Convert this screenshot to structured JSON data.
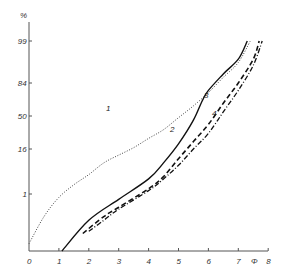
{
  "chart_data": {
    "type": "line",
    "title": "",
    "xlabel": "Φ",
    "ylabel": "%",
    "x_ticks": [
      "0",
      "1",
      "2",
      "3",
      "4",
      "5",
      "6",
      "7",
      "8"
    ],
    "y_ticks": [
      "99",
      "84",
      "50",
      "16",
      "1"
    ],
    "y_tick_values": [
      99,
      84,
      50,
      16,
      1
    ],
    "xlim": [
      0,
      8
    ],
    "y_scale": "probability",
    "grid": false,
    "series": [
      {
        "name": "1",
        "style": "dotted",
        "points": [
          [
            0,
            0.02
          ],
          [
            0.5,
            0.2
          ],
          [
            1,
            0.8
          ],
          [
            1.5,
            2
          ],
          [
            2,
            4
          ],
          [
            2.5,
            8
          ],
          [
            3,
            12
          ],
          [
            3.5,
            17
          ],
          [
            4,
            25
          ],
          [
            4.5,
            34
          ],
          [
            5,
            48
          ],
          [
            5.5,
            62
          ],
          [
            6,
            76
          ],
          [
            6.5,
            88
          ],
          [
            7,
            95
          ],
          [
            7.4,
            99
          ]
        ]
      },
      {
        "name": "2",
        "style": "solid",
        "points": [
          [
            1.1,
            0.01
          ],
          [
            2,
            0.15
          ],
          [
            3,
            0.7
          ],
          [
            4,
            3
          ],
          [
            4.5,
            8
          ],
          [
            5,
            20
          ],
          [
            5.5,
            45
          ],
          [
            5.8,
            68
          ],
          [
            6,
            78
          ],
          [
            6.5,
            90
          ],
          [
            7,
            96
          ],
          [
            7.3,
            99
          ]
        ]
      },
      {
        "name": "3",
        "style": "dashed",
        "points": [
          [
            1.8,
            0.05
          ],
          [
            2.5,
            0.2
          ],
          [
            3,
            0.4
          ],
          [
            4,
            1.5
          ],
          [
            4.5,
            3.5
          ],
          [
            5,
            10
          ],
          [
            5.5,
            22
          ],
          [
            6,
            40
          ],
          [
            6.5,
            65
          ],
          [
            7,
            84
          ],
          [
            7.5,
            96
          ],
          [
            7.7,
            99
          ]
        ]
      },
      {
        "name": "4",
        "style": "dash-dot",
        "points": [
          [
            2,
            0.06
          ],
          [
            2.5,
            0.15
          ],
          [
            3,
            0.35
          ],
          [
            4,
            1.3
          ],
          [
            4.5,
            3
          ],
          [
            5,
            7
          ],
          [
            5.5,
            16
          ],
          [
            6,
            30
          ],
          [
            6.5,
            55
          ],
          [
            7,
            78
          ],
          [
            7.5,
            94
          ],
          [
            7.8,
            99
          ]
        ]
      }
    ],
    "curve_labels": [
      "1",
      "2",
      "3",
      "4"
    ]
  }
}
